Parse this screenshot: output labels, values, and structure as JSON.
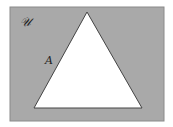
{
  "diagram": {
    "type": "venn",
    "universal_set": {
      "label": "𝒰",
      "fill": "#a9a9a9"
    },
    "set_a": {
      "label": "A",
      "shape": "triangle",
      "fill": "#ffffff"
    },
    "shaded_region": "complement of A",
    "colors": {
      "shade": "#a9a9a9",
      "border": "#555555",
      "background": "#ffffff"
    }
  }
}
